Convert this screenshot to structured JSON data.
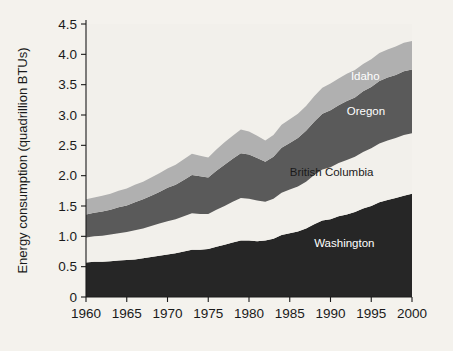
{
  "chart_data": {
    "type": "area",
    "stacked": true,
    "title": "",
    "xlabel": "",
    "ylabel": "Energy consumption (quadrillion BTUs)",
    "xlim": [
      1960,
      2000
    ],
    "ylim": [
      0,
      4.5
    ],
    "grid": false,
    "legend_position": "inline-labels",
    "xticks": [
      1960,
      1965,
      1970,
      1975,
      1980,
      1985,
      1990,
      1995,
      2000
    ],
    "xtick_labels": [
      "1960",
      "1965",
      "1970",
      "1975",
      "1980",
      "1985",
      "1990",
      "1995",
      "2000"
    ],
    "yticks": [
      0,
      0.5,
      1.0,
      1.5,
      2.0,
      2.5,
      3.0,
      3.5,
      4.0,
      4.5
    ],
    "ytick_labels": [
      "0",
      "0.5",
      "1.0",
      "1.5",
      "2.0",
      "2.5",
      "3.0",
      "3.5",
      "4.0",
      "4.5"
    ],
    "x": [
      1960,
      1961,
      1962,
      1963,
      1964,
      1965,
      1966,
      1967,
      1968,
      1969,
      1970,
      1971,
      1972,
      1973,
      1974,
      1975,
      1976,
      1977,
      1978,
      1979,
      1980,
      1981,
      1982,
      1983,
      1984,
      1985,
      1986,
      1987,
      1988,
      1989,
      1990,
      1991,
      1992,
      1993,
      1994,
      1995,
      1996,
      1997,
      1998,
      1999,
      2000
    ],
    "series": [
      {
        "name": "Washington",
        "color": "#262626",
        "label_color": "#ffffff",
        "values": [
          0.57,
          0.58,
          0.58,
          0.59,
          0.6,
          0.61,
          0.62,
          0.64,
          0.66,
          0.68,
          0.7,
          0.72,
          0.75,
          0.78,
          0.78,
          0.79,
          0.83,
          0.86,
          0.9,
          0.93,
          0.93,
          0.92,
          0.93,
          0.96,
          1.02,
          1.05,
          1.08,
          1.13,
          1.2,
          1.26,
          1.28,
          1.33,
          1.36,
          1.4,
          1.46,
          1.5,
          1.56,
          1.6,
          1.63,
          1.67,
          1.7
        ]
      },
      {
        "name": "British Columbia",
        "color": "#f2f0eb",
        "label_color": "#1a1a1a",
        "values": [
          0.41,
          0.42,
          0.43,
          0.44,
          0.45,
          0.46,
          0.48,
          0.49,
          0.51,
          0.53,
          0.55,
          0.56,
          0.58,
          0.6,
          0.59,
          0.58,
          0.61,
          0.64,
          0.67,
          0.7,
          0.69,
          0.67,
          0.64,
          0.66,
          0.7,
          0.72,
          0.74,
          0.77,
          0.81,
          0.84,
          0.86,
          0.88,
          0.9,
          0.91,
          0.93,
          0.95,
          0.97,
          0.98,
          0.99,
          1.0,
          1.0
        ]
      },
      {
        "name": "Oregon",
        "color": "#5a5a5a",
        "label_color": "#ffffff",
        "values": [
          0.38,
          0.39,
          0.4,
          0.41,
          0.43,
          0.44,
          0.46,
          0.48,
          0.5,
          0.52,
          0.55,
          0.57,
          0.6,
          0.63,
          0.62,
          0.6,
          0.64,
          0.68,
          0.71,
          0.74,
          0.73,
          0.7,
          0.66,
          0.69,
          0.74,
          0.77,
          0.8,
          0.84,
          0.88,
          0.92,
          0.94,
          0.95,
          0.97,
          0.98,
          1.0,
          1.01,
          1.03,
          1.04,
          1.04,
          1.05,
          1.05
        ]
      },
      {
        "name": "Idaho",
        "color": "#b0b0b0",
        "label_color": "#ffffff",
        "values": [
          0.25,
          0.25,
          0.26,
          0.26,
          0.27,
          0.28,
          0.29,
          0.29,
          0.3,
          0.31,
          0.32,
          0.33,
          0.34,
          0.35,
          0.34,
          0.33,
          0.35,
          0.37,
          0.38,
          0.39,
          0.38,
          0.37,
          0.35,
          0.36,
          0.38,
          0.39,
          0.4,
          0.41,
          0.42,
          0.43,
          0.44,
          0.44,
          0.45,
          0.45,
          0.45,
          0.46,
          0.46,
          0.46,
          0.47,
          0.47,
          0.47
        ]
      }
    ],
    "annotations": [
      {
        "text": "Idaho",
        "x": 1992.5,
        "y": 3.58,
        "anchor": "start",
        "color": "#ffffff"
      },
      {
        "text": "Oregon",
        "x": 1992.0,
        "y": 3.0,
        "anchor": "start",
        "color": "#ffffff"
      },
      {
        "text": "British Columbia",
        "x": 1985.0,
        "y": 2.0,
        "anchor": "start",
        "color": "#1a1a1a"
      },
      {
        "text": "Washington",
        "x": 1988.0,
        "y": 0.82,
        "anchor": "start",
        "color": "#ffffff"
      }
    ]
  }
}
